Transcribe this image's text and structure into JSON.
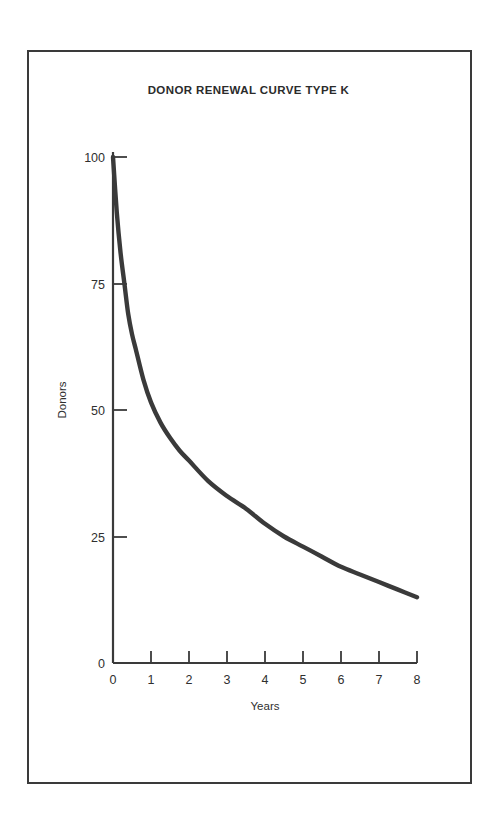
{
  "chart_data": {
    "type": "line",
    "title": "DONOR RENEWAL CURVE TYPE K",
    "xlabel": "Years",
    "ylabel": "Donors",
    "xlim": [
      0,
      8
    ],
    "ylim": [
      0,
      100
    ],
    "grid": false,
    "legend": null,
    "xticks": [
      "0",
      "1",
      "2",
      "3",
      "4",
      "5",
      "6",
      "7",
      "8"
    ],
    "xtick_values": [
      0,
      1,
      2,
      3,
      4,
      5,
      6,
      7,
      8
    ],
    "yticks": [
      "0",
      "25",
      "50",
      "75",
      "100"
    ],
    "ytick_values": [
      0,
      25,
      50,
      75,
      100
    ],
    "series": [
      {
        "name": "Donor renewal curve type K",
        "x": [
          0,
          0.1,
          0.2,
          0.3,
          0.4,
          0.5,
          0.6,
          0.8,
          1,
          1.25,
          1.5,
          1.75,
          2,
          2.5,
          3,
          3.5,
          4,
          4.5,
          5,
          5.5,
          6,
          6.5,
          7,
          7.5,
          8
        ],
        "values": [
          100,
          89,
          81,
          75,
          69,
          65,
          62,
          56,
          51.5,
          47.5,
          44.5,
          42,
          40,
          36,
          33,
          30.5,
          27.5,
          25,
          23,
          21,
          19,
          17.5,
          16,
          14.5,
          13
        ]
      }
    ]
  },
  "colors": {
    "curve": "#3a3a3a",
    "axis": "#3a3a3a",
    "frame": "#3a3a3a",
    "text": "#2b2b2b",
    "background": "#ffffff"
  }
}
